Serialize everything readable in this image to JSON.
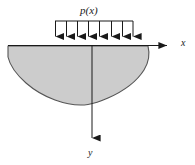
{
  "figure": {
    "background_color": "#ffffff",
    "line_color": "#1a1a1a",
    "body_fill_color": "#cccccc",
    "body_stroke_color": "#555555"
  },
  "labels": {
    "load": "p(x)",
    "x_axis": "x",
    "y_axis": "y"
  },
  "axes": {
    "origin": {
      "x": 92,
      "y": 45
    },
    "x_axis": {
      "start_x": 8,
      "end_x": 176,
      "y": 45,
      "arrow": "right",
      "label": "x"
    },
    "y_axis": {
      "x": 92,
      "start_y": 45,
      "end_y": 147,
      "arrow": "down",
      "label": "y"
    }
  },
  "load": {
    "label": "p(x)",
    "bar_y": 21,
    "bar_start_x": 55,
    "bar_end_x": 133,
    "arrow_count": 8,
    "arrow_tip_y": 45,
    "arrow_direction": "down",
    "arrow_x_positions": [
      55,
      66,
      77,
      88,
      99,
      111,
      122,
      133
    ]
  },
  "body": {
    "shape": "rounded solid region below the x-axis",
    "top_left_x": 8,
    "top_right_x": 148,
    "top_y": 46,
    "lowest_y": 105,
    "fill": "#cccccc",
    "stroke": "#555555"
  }
}
